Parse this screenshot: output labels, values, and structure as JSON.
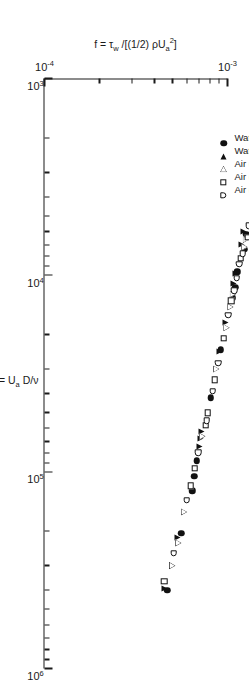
{
  "figure": {
    "title": "",
    "xaxis_label_html": "Re = U<sub>a</sub> D/ν",
    "yaxis_label_html": "f = τ<sub>w</sub> /[(1/2) ρU<sub>a</sub><sup>2</sup>]",
    "xaxis_label_plain": "Re = Ua D/v",
    "yaxis_label_plain": "f = τw /[(1/2) ρUa2]"
  },
  "axis_ticks": {
    "x_major_labels": [
      "10³",
      "10⁴",
      "10⁵",
      "10⁶"
    ],
    "x_major_values": [
      1000,
      10000,
      100000,
      1000000
    ],
    "y_major_labels": [
      "10⁻⁴",
      "10⁻³"
    ],
    "y_major_values": [
      0.0001,
      0.001
    ]
  },
  "legend": {
    "position": "upper-left-inside",
    "entries": [
      {
        "label": "Water (Ref. 1)",
        "marker": "filled-circle"
      },
      {
        "label": "Water (Ref. 2)",
        "marker": "filled-triangle"
      },
      {
        "label": "Air (Ref. 2)",
        "marker": "open-triangle"
      },
      {
        "label": "Air (Ref. 3)",
        "marker": "open-square"
      },
      {
        "label": "Air (Ref. 4)",
        "marker": "open-dsquare"
      }
    ]
  },
  "colors": {
    "ink": "#1a1a1a",
    "marker_fill": "#111111",
    "background": "#ffffff"
  },
  "chart_data": {
    "type": "scatter",
    "title": "",
    "xlabel": "Re = Ua D/v",
    "ylabel": "f = tau_w / [(1/2) rho Ua^2]",
    "xscale": "log",
    "yscale": "log",
    "xlim": [
      1000,
      1000000
    ],
    "ylim": [
      0.0001,
      0.001
    ],
    "grid": false,
    "legend_position": "upper-left-inside",
    "series": [
      {
        "name": "Water (Ref. 1)",
        "marker": "filled-circle",
        "points": [
          [
            6200,
            0.00127
          ],
          [
            7400,
            0.00124
          ],
          [
            9600,
            0.00113
          ],
          [
            11500,
            0.0011
          ],
          [
            13000,
            0.00107
          ],
          [
            24000,
            0.00092
          ],
          [
            42000,
            0.00081
          ],
          [
            88000,
            0.00068
          ],
          [
            105000,
            0.00066
          ],
          [
            125000,
            0.00064
          ],
          [
            205000,
            0.00056
          ],
          [
            400000,
            0.00047
          ]
        ]
      },
      {
        "name": "Water (Ref. 2)",
        "marker": "filled-triangle",
        "points": [
          [
            6000,
            0.00122
          ],
          [
            7000,
            0.00119
          ],
          [
            9800,
            0.0011
          ],
          [
            11000,
            0.00108
          ],
          [
            17500,
            0.00098
          ],
          [
            24500,
            0.0009
          ],
          [
            62000,
            0.00072
          ],
          [
            68000,
            0.00071
          ],
          [
            74000,
            0.0007
          ],
          [
            215000,
            0.00053
          ],
          [
            390000,
            0.00045
          ]
        ]
      },
      {
        "name": "Air (Ref. 2)",
        "marker": "open-triangle",
        "points": [
          [
            6600,
            0.00126
          ],
          [
            7200,
            0.00124
          ],
          [
            12500,
            0.00107
          ],
          [
            14500,
            0.00104
          ],
          [
            18500,
            0.00099
          ],
          [
            30000,
            0.00087
          ],
          [
            66000,
            0.00073
          ],
          [
            160000,
            0.00058
          ],
          [
            230000,
            0.00054
          ],
          [
            300000,
            0.0005
          ]
        ]
      },
      {
        "name": "Air (Ref. 3)",
        "marker": "open-square",
        "points": [
          [
            6400,
            0.00129
          ],
          [
            8200,
            0.00118
          ],
          [
            13500,
            0.00105
          ],
          [
            21000,
            0.00095
          ],
          [
            34000,
            0.00085
          ],
          [
            50000,
            0.00078
          ],
          [
            58000,
            0.00076
          ],
          [
            96000,
            0.00066
          ],
          [
            118000,
            0.00063
          ],
          [
            360000,
            0.00045
          ]
        ]
      },
      {
        "name": "Air (Ref. 4)",
        "marker": "open-dsquare",
        "points": [
          [
            5600,
            0.00131
          ],
          [
            7800,
            0.00121
          ],
          [
            8800,
            0.00116
          ],
          [
            10400,
            0.00112
          ],
          [
            12000,
            0.00109
          ],
          [
            16000,
            0.00101
          ],
          [
            28000,
            0.00089
          ],
          [
            39000,
            0.00083
          ],
          [
            55000,
            0.00077
          ],
          [
            80000,
            0.00069
          ],
          [
            140000,
            0.0006
          ],
          [
            260000,
            0.00051
          ]
        ]
      }
    ]
  }
}
